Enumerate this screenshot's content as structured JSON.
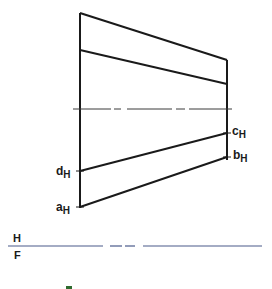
{
  "diagram": {
    "type": "orthographic-projection",
    "view": "horizontal (top) view",
    "points": [
      {
        "name": "a",
        "subscript": "H",
        "x": 80,
        "y": 207
      },
      {
        "name": "b",
        "subscript": "H",
        "x": 227,
        "y": 157
      },
      {
        "name": "c",
        "subscript": "H",
        "x": 227,
        "y": 133
      },
      {
        "name": "d",
        "subscript": "H",
        "x": 80,
        "y": 171
      }
    ],
    "fold_line": {
      "upper_label": "H",
      "lower_label": "F",
      "y": 246
    },
    "colors": {
      "ink": "#1a1a1a",
      "fold_line": "#4a5a8a",
      "centerline": "#3a3a3a"
    }
  },
  "labels": {
    "a": "a",
    "b": "b",
    "c": "c",
    "d": "d",
    "sub": "H",
    "fold_upper": "H",
    "fold_lower": "F"
  }
}
